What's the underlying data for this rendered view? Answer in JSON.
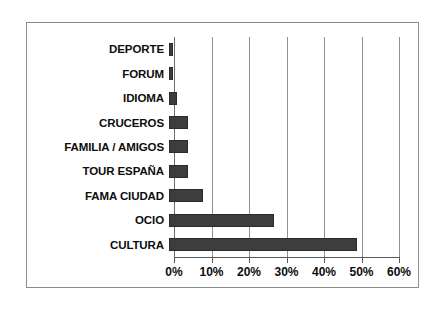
{
  "chart_data": {
    "type": "bar",
    "orientation": "horizontal",
    "title": "",
    "subtitle": "",
    "xlabel": "",
    "ylabel": "",
    "categories": [
      "DEPORTE",
      "FORUM",
      "IDIOMA",
      "CRUCEROS",
      "FAMILIA / AMIGOS",
      "TOUR ESPAÑA",
      "FAMA CIUDAD",
      "OCIO",
      "CULTURA"
    ],
    "values": [
      1,
      1,
      2,
      5,
      5,
      5,
      9,
      28,
      50
    ],
    "value_unit": "%",
    "xlim": [
      0,
      60
    ],
    "xticks": [
      0,
      10,
      20,
      30,
      40,
      50,
      60
    ],
    "xtick_labels": [
      "0%",
      "10%",
      "20%",
      "30%",
      "40%",
      "50%",
      "60%"
    ],
    "grid": true,
    "grid_axis": "x",
    "legend": false,
    "legend_position": "none",
    "bar_color": "#3d3d3d",
    "grid_color": "#8f8f8f",
    "axis_color": "#5a5a5a",
    "frame_color": "#8c8c8c",
    "label_color": "#0d0d0d",
    "background": "#ffffff"
  }
}
